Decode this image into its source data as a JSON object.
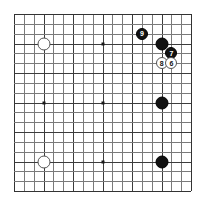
{
  "board": {
    "type": "go-board",
    "size": 19,
    "columns": 19,
    "rows": 19,
    "grid_origin_px": [
      14,
      14
    ],
    "grid_extent_px": [
      191,
      191
    ],
    "cell_px": 9.85,
    "line_color": "#7a7a7a",
    "heavy_line_color": "#3c3c3c",
    "edge_color": "#333333",
    "background_color": "#ffffff",
    "star_point_color": "#1a1a1a",
    "star_points": [
      {
        "col": 3,
        "row": 3
      },
      {
        "col": 9,
        "row": 3
      },
      {
        "col": 15,
        "row": 3
      },
      {
        "col": 3,
        "row": 9
      },
      {
        "col": 9,
        "row": 9
      },
      {
        "col": 15,
        "row": 9
      },
      {
        "col": 3,
        "row": 15
      },
      {
        "col": 9,
        "row": 15
      },
      {
        "col": 15,
        "row": 15
      }
    ],
    "heavy_gridlines_every": 3
  },
  "stones": [
    {
      "id": "white-upper-left-hoshi",
      "color": "white",
      "col": 3,
      "row": 3,
      "label": "",
      "numbered": false
    },
    {
      "id": "white-lower-left-hoshi",
      "color": "white",
      "col": 3,
      "row": 15,
      "label": "",
      "numbered": false
    },
    {
      "id": "black-move-9",
      "color": "black",
      "col": 13,
      "row": 2,
      "label": "9",
      "numbered": true
    },
    {
      "id": "black-upper-right",
      "color": "black",
      "col": 15,
      "row": 3,
      "label": "",
      "numbered": false
    },
    {
      "id": "black-move-7",
      "color": "black",
      "col": 16,
      "row": 4,
      "label": "7",
      "numbered": true
    },
    {
      "id": "white-move-8",
      "color": "white",
      "col": 15,
      "row": 5,
      "label": "8",
      "numbered": true
    },
    {
      "id": "white-move-6",
      "color": "white",
      "col": 16,
      "row": 5,
      "label": "6",
      "numbered": true
    },
    {
      "id": "black-right-hoshi",
      "color": "black",
      "col": 15,
      "row": 9,
      "label": "",
      "numbered": false
    },
    {
      "id": "black-lower-right-hoshi",
      "color": "black",
      "col": 15,
      "row": 15,
      "label": "",
      "numbered": false
    }
  ]
}
